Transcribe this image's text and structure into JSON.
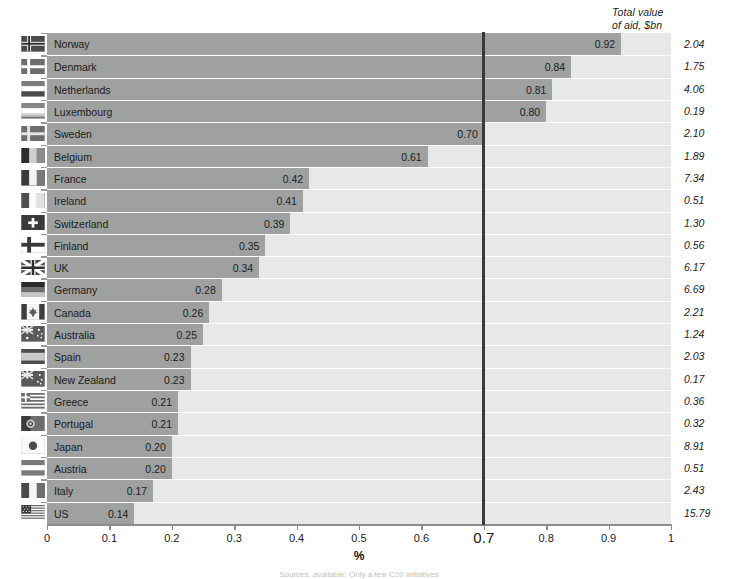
{
  "header": {
    "totals_column_title_line1": "Total value",
    "totals_column_title_line2": "of aid, $bn"
  },
  "axis": {
    "title": "%",
    "tick_labels": [
      "0",
      "0.1",
      "0.2",
      "0.3",
      "0.4",
      "0.5",
      "0.6",
      "0.7",
      "0.8",
      "0.9",
      "1"
    ],
    "highlight_tick": "0.7",
    "xmin": 0,
    "xmax": 1
  },
  "threshold": {
    "value": 0.7,
    "color": "#3a3a3a"
  },
  "colors": {
    "bar": "#9fa0a0",
    "track": "#e7e8e8",
    "axis": "#8d8d8d",
    "text": "#1c1c1c"
  },
  "source": {
    "note": "Sources: available; Only a few C20 initiatives"
  },
  "chart_data": {
    "type": "bar",
    "title": "",
    "subtitle": "",
    "xlabel": "%",
    "ylabel": "",
    "xlim": [
      0,
      1
    ],
    "grid": false,
    "orientation": "horizontal",
    "legend": "none",
    "annotations": [
      {
        "type": "vline",
        "x": 0.7,
        "label": "0.7"
      }
    ],
    "categories": [
      "Norway",
      "Denmark",
      "Netherlands",
      "Luxembourg",
      "Sweden",
      "Belgium",
      "France",
      "Ireland",
      "Switzerland",
      "Finland",
      "UK",
      "Germany",
      "Canada",
      "Australia",
      "Spain",
      "New Zealand",
      "Greece",
      "Portugal",
      "Japan",
      "Austria",
      "Italy",
      "US"
    ],
    "values": [
      0.92,
      0.84,
      0.81,
      0.8,
      0.7,
      0.61,
      0.42,
      0.41,
      0.39,
      0.35,
      0.34,
      0.28,
      0.26,
      0.25,
      0.23,
      0.23,
      0.21,
      0.21,
      0.2,
      0.2,
      0.17,
      0.14
    ],
    "value_labels": [
      "0.92",
      "0.84",
      "0.81",
      "0.80",
      "0.70",
      "0.61",
      "0.42",
      "0.41",
      "0.39",
      "0.35",
      "0.34",
      "0.28",
      "0.26",
      "0.25",
      "0.23",
      "0.23",
      "0.21",
      "0.21",
      "0.20",
      "0.20",
      "0.17",
      "0.14"
    ],
    "series": [
      {
        "name": "Aid as % of gross national income",
        "values": [
          0.92,
          0.84,
          0.81,
          0.8,
          0.7,
          0.61,
          0.42,
          0.41,
          0.39,
          0.35,
          0.34,
          0.28,
          0.26,
          0.25,
          0.23,
          0.23,
          0.21,
          0.21,
          0.2,
          0.2,
          0.17,
          0.14
        ]
      },
      {
        "name": "Total value of aid, $bn",
        "values": [
          2.04,
          1.75,
          4.06,
          0.19,
          2.1,
          1.89,
          7.34,
          0.51,
          1.3,
          0.56,
          6.17,
          6.69,
          2.21,
          1.24,
          2.03,
          0.17,
          0.36,
          0.32,
          8.91,
          0.51,
          2.43,
          15.79
        ]
      }
    ],
    "totals": [
      "2.04",
      "1.75",
      "4.06",
      "0.19",
      "2.10",
      "1.89",
      "7.34",
      "0.51",
      "1.30",
      "0.56",
      "6.17",
      "6.69",
      "2.21",
      "1.24",
      "2.03",
      "0.17",
      "0.36",
      "0.32",
      "8.91",
      "0.51",
      "2.43",
      "15.79"
    ],
    "flags": [
      "flag-norway",
      "flag-denmark",
      "flag-netherlands",
      "flag-luxembourg",
      "flag-sweden",
      "flag-belgium",
      "flag-france",
      "flag-ireland",
      "flag-switzerland",
      "flag-finland",
      "flag-uk",
      "flag-germany",
      "flag-canada",
      "flag-australia",
      "flag-spain",
      "flag-new-zealand",
      "flag-greece",
      "flag-portugal",
      "flag-japan",
      "flag-austria",
      "flag-italy",
      "flag-us"
    ]
  }
}
